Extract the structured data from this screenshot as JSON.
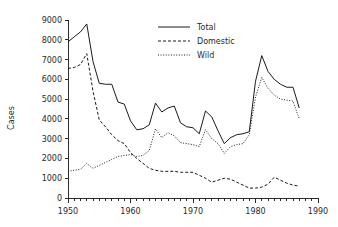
{
  "chart_data": {
    "type": "line",
    "title": "",
    "xlabel": "",
    "ylabel": "Cases",
    "xlim": [
      1950,
      1990
    ],
    "ylim": [
      0,
      9000
    ],
    "grid": false,
    "legend_position": "top-center",
    "x_ticks_major": [
      1950,
      1960,
      1970,
      1980,
      1990
    ],
    "x_tick_labels": [
      "1950",
      "1960",
      "1970",
      "1980",
      "1990"
    ],
    "x_minor_tick_step": 1,
    "y_ticks": [
      0,
      1000,
      2000,
      3000,
      4000,
      5000,
      6000,
      7000,
      8000,
      9000
    ],
    "y_tick_labels": [
      "0",
      "1000",
      "2000",
      "3000",
      "4000",
      "5000",
      "6000",
      "7000",
      "8000",
      "9000"
    ],
    "x": [
      1950,
      1951,
      1952,
      1953,
      1954,
      1955,
      1956,
      1957,
      1958,
      1959,
      1960,
      1961,
      1962,
      1963,
      1964,
      1965,
      1966,
      1967,
      1968,
      1969,
      1970,
      1971,
      1972,
      1973,
      1974,
      1975,
      1976,
      1977,
      1978,
      1979,
      1980,
      1981,
      1982,
      1983,
      1984,
      1985,
      1986,
      1987
    ],
    "series": [
      {
        "name": "Total",
        "style": "solid",
        "color": "#1a1a1a",
        "values": [
          7900,
          8150,
          8400,
          8800,
          6900,
          5800,
          5750,
          5750,
          4850,
          4750,
          3900,
          3450,
          3500,
          3700,
          4800,
          4350,
          4550,
          4650,
          3800,
          3600,
          3550,
          3250,
          4400,
          4100,
          3400,
          2750,
          3050,
          3200,
          3250,
          3350,
          5900,
          7200,
          6400,
          6000,
          5750,
          5600,
          5600,
          4550
        ]
      },
      {
        "name": "Domestic",
        "style": "dashed",
        "color": "#1a1a1a",
        "values": [
          6550,
          6600,
          6750,
          7300,
          5400,
          3950,
          3600,
          3200,
          2900,
          2750,
          2300,
          2000,
          1750,
          1500,
          1400,
          1350,
          1350,
          1350,
          1300,
          1300,
          1300,
          1150,
          1000,
          800,
          900,
          1000,
          950,
          800,
          650,
          500,
          500,
          550,
          700,
          1050,
          900,
          750,
          650,
          600
        ]
      },
      {
        "name": "Wild",
        "style": "dotted",
        "color": "#1a1a1a",
        "values": [
          1350,
          1400,
          1450,
          1750,
          1500,
          1650,
          1800,
          1950,
          2100,
          2150,
          2200,
          2100,
          2150,
          2400,
          3500,
          3050,
          3300,
          3150,
          2800,
          2750,
          2700,
          2600,
          3450,
          3000,
          2750,
          2250,
          2600,
          2700,
          2750,
          3200,
          5100,
          6100,
          5550,
          5200,
          5000,
          4950,
          4900,
          4000
        ]
      }
    ],
    "legend": [
      {
        "label": "Total",
        "style": "solid"
      },
      {
        "label": "Domestic",
        "style": "dashed"
      },
      {
        "label": "Wild",
        "style": "dotted"
      }
    ]
  }
}
